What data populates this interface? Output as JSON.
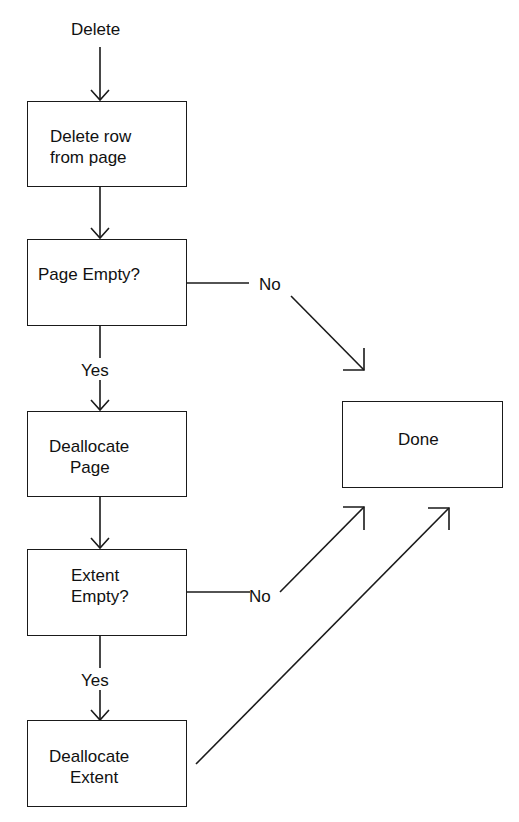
{
  "diagram": {
    "type": "flowchart",
    "start_label": "Delete",
    "nodes": [
      {
        "id": "delete-row",
        "lines": [
          "Delete row",
          "from page"
        ]
      },
      {
        "id": "page-empty",
        "lines": [
          "Page Empty?"
        ]
      },
      {
        "id": "dealloc-page",
        "lines": [
          "Deallocate",
          "Page"
        ]
      },
      {
        "id": "extent-empty",
        "lines": [
          "Extent",
          "Empty?"
        ]
      },
      {
        "id": "dealloc-extent",
        "lines": [
          "Deallocate",
          "Extent"
        ]
      },
      {
        "id": "done",
        "lines": [
          "Done"
        ]
      }
    ],
    "edges": [
      {
        "from": "start",
        "to": "delete-row",
        "label": ""
      },
      {
        "from": "delete-row",
        "to": "page-empty",
        "label": ""
      },
      {
        "from": "page-empty",
        "to": "dealloc-page",
        "label": "Yes"
      },
      {
        "from": "page-empty",
        "to": "done",
        "label": "No"
      },
      {
        "from": "dealloc-page",
        "to": "extent-empty",
        "label": ""
      },
      {
        "from": "extent-empty",
        "to": "dealloc-extent",
        "label": "Yes"
      },
      {
        "from": "extent-empty",
        "to": "done",
        "label": "No"
      },
      {
        "from": "dealloc-extent",
        "to": "done",
        "label": ""
      }
    ]
  }
}
